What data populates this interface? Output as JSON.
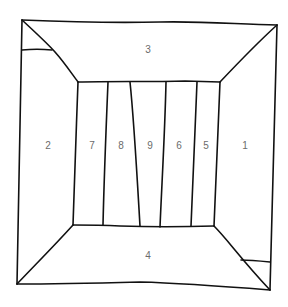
{
  "diagram": {
    "line_color": "#111111",
    "label_color": "#6b6b6b",
    "regions": [
      {
        "id": "ceiling",
        "label": "3"
      },
      {
        "id": "left-wall",
        "label": "2"
      },
      {
        "id": "back-panel-1",
        "label": "7"
      },
      {
        "id": "back-panel-2",
        "label": "8"
      },
      {
        "id": "back-panel-3",
        "label": "9"
      },
      {
        "id": "back-panel-4",
        "label": "6"
      },
      {
        "id": "back-panel-5",
        "label": "5"
      },
      {
        "id": "right-wall",
        "label": "1"
      },
      {
        "id": "floor",
        "label": "4"
      }
    ]
  }
}
